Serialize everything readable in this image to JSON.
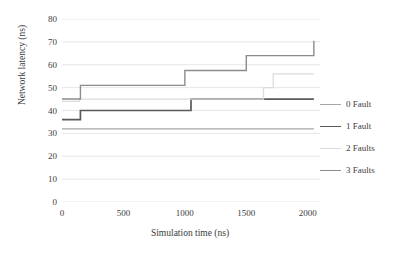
{
  "chart_data": {
    "type": "line",
    "title": "",
    "xlabel": "Simulation time (ns)",
    "ylabel": "Network latency (ns)",
    "xlim": [
      0,
      2100
    ],
    "ylim": [
      0,
      80
    ],
    "xticks": [
      "0",
      "500",
      "1000",
      "1500",
      "2000"
    ],
    "xtick_values": [
      0,
      500,
      1000,
      1500,
      2000
    ],
    "yticks": [
      "0",
      "10",
      "20",
      "30",
      "40",
      "50",
      "60",
      "70",
      "80"
    ],
    "ytick_values": [
      0,
      10,
      20,
      30,
      40,
      50,
      60,
      70,
      80
    ],
    "grid": "horizontal",
    "legend_position": "right",
    "step_type": "post",
    "series": [
      {
        "name": "0 Fault",
        "color": "#a6a6a6",
        "width": 1.3,
        "x": [
          0,
          2050
        ],
        "values": [
          32,
          32
        ]
      },
      {
        "name": "1 Fault",
        "color": "#5a5a5a",
        "width": 1.7,
        "x": [
          0,
          150,
          1050,
          2050
        ],
        "values": [
          36,
          40,
          45,
          45
        ]
      },
      {
        "name": "2 Faults",
        "color": "#dcdcdc",
        "width": 1.3,
        "x": [
          0,
          140,
          1640,
          1720,
          2050
        ],
        "values": [
          44,
          45,
          50,
          56,
          56
        ]
      },
      {
        "name": "3 Faults",
        "color": "#8c8c8c",
        "width": 1.4,
        "x": [
          0,
          150,
          1000,
          1500,
          2050
        ],
        "values": [
          45,
          51,
          57.5,
          64,
          70.5
        ]
      }
    ]
  }
}
